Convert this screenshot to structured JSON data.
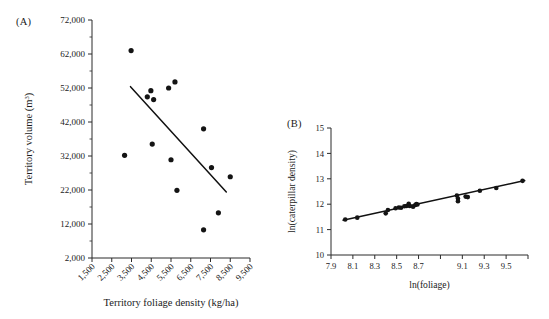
{
  "figure": {
    "panels": [
      {
        "label": "(A)",
        "xlabel": "Territory foliage density (kg/ha)",
        "ylabel_main": "Territory volume (m",
        "ylabel_sup": "3",
        "ylabel_tail": ")"
      },
      {
        "label": "(B)",
        "xlabel": "ln(foliage)",
        "ylabel": "ln(caterpillar density)"
      }
    ]
  },
  "chart_data": [
    {
      "type": "scatter",
      "panel": "A",
      "title": "",
      "xlabel": "Territory foliage density (kg/ha)",
      "ylabel": "Territory volume (m3)",
      "xlim": [
        1500,
        9500
      ],
      "ylim": [
        2000,
        72000
      ],
      "xticks": [
        1500,
        2500,
        3500,
        4500,
        5500,
        6500,
        7500,
        8500,
        9500
      ],
      "xtick_labels": [
        "1,500",
        "2,500",
        "3,500",
        "4,500",
        "5,500",
        "6,500",
        "7,500",
        "8,500",
        "9,500"
      ],
      "xtick_rotation": -45,
      "yticks": [
        2000,
        12000,
        22000,
        32000,
        42000,
        52000,
        62000,
        72000
      ],
      "ytick_labels": [
        "2,000",
        "12,000",
        "22,000",
        "32,000",
        "42,000",
        "52,000",
        "62,000",
        "72,000"
      ],
      "grid": false,
      "legend": false,
      "points": [
        {
          "x": 3150,
          "y": 32200
        },
        {
          "x": 3480,
          "y": 63000
        },
        {
          "x": 4300,
          "y": 49400
        },
        {
          "x": 4480,
          "y": 51200
        },
        {
          "x": 4620,
          "y": 48600
        },
        {
          "x": 4550,
          "y": 35500
        },
        {
          "x": 5380,
          "y": 52000
        },
        {
          "x": 5700,
          "y": 53800
        },
        {
          "x": 5500,
          "y": 30900
        },
        {
          "x": 5800,
          "y": 21900
        },
        {
          "x": 7150,
          "y": 40000
        },
        {
          "x": 7150,
          "y": 10300
        },
        {
          "x": 7550,
          "y": 28600
        },
        {
          "x": 7900,
          "y": 15300
        },
        {
          "x": 8500,
          "y": 25900
        }
      ],
      "fit_line": {
        "x0": 3450,
        "y0": 52400,
        "x1": 8300,
        "y1": 21400
      }
    },
    {
      "type": "scatter",
      "panel": "B",
      "title": "",
      "xlabel": "ln(foliage)",
      "ylabel": "ln(caterpillar density)",
      "xlim": [
        7.9,
        9.7
      ],
      "ylim": [
        10,
        15
      ],
      "xticks": [
        7.9,
        8.1,
        8.3,
        8.5,
        8.7,
        8.9,
        9.1,
        9.3,
        9.5,
        9.7
      ],
      "xtick_labels": [
        "7.9",
        "8.1",
        "8.3",
        "8.5",
        "8.7",
        "9.1",
        "9.3",
        "9.5",
        "9.7"
      ],
      "yticks": [
        10,
        11,
        12,
        13,
        14,
        15
      ],
      "ytick_labels": [
        "10",
        "11",
        "12",
        "13",
        "14",
        "15"
      ],
      "grid": false,
      "legend": false,
      "points": [
        {
          "x": 8.03,
          "y": 11.4
        },
        {
          "x": 8.14,
          "y": 11.47
        },
        {
          "x": 8.4,
          "y": 11.64
        },
        {
          "x": 8.42,
          "y": 11.77
        },
        {
          "x": 8.49,
          "y": 11.84
        },
        {
          "x": 8.52,
          "y": 11.87
        },
        {
          "x": 8.54,
          "y": 11.86
        },
        {
          "x": 8.57,
          "y": 11.92
        },
        {
          "x": 8.59,
          "y": 11.93
        },
        {
          "x": 8.61,
          "y": 12.02
        },
        {
          "x": 8.62,
          "y": 11.93
        },
        {
          "x": 8.65,
          "y": 11.9
        },
        {
          "x": 8.67,
          "y": 11.97
        },
        {
          "x": 8.68,
          "y": 12.01
        },
        {
          "x": 8.69,
          "y": 11.99
        },
        {
          "x": 9.05,
          "y": 12.34
        },
        {
          "x": 9.06,
          "y": 12.22
        },
        {
          "x": 9.06,
          "y": 12.12
        },
        {
          "x": 9.13,
          "y": 12.3
        },
        {
          "x": 9.15,
          "y": 12.28
        },
        {
          "x": 9.26,
          "y": 12.53
        },
        {
          "x": 9.41,
          "y": 12.64
        },
        {
          "x": 9.65,
          "y": 12.92
        }
      ],
      "fit_line": {
        "x0": 8.01,
        "y0": 11.37,
        "x1": 9.67,
        "y1": 12.93
      }
    }
  ]
}
